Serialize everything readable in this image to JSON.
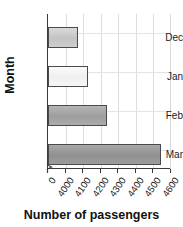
{
  "chart_data": {
    "type": "bar",
    "orientation": "horizontal",
    "title": "",
    "xlabel": "Number of passengers",
    "ylabel": "Month",
    "categories": [
      "Dec",
      "Jan",
      "Feb",
      "Mar"
    ],
    "values": [
      4120,
      4180,
      4285,
      4590
    ],
    "xlim": [
      3950,
      4650
    ],
    "xticks": [
      0,
      4000,
      4100,
      4200,
      4300,
      4400,
      4500,
      4600
    ],
    "xtick_labels": [
      "0",
      "4000",
      "4100",
      "4200",
      "4300",
      "4400",
      "4500",
      "4600"
    ],
    "axis_break": true,
    "grid": true,
    "legend": "none",
    "bar_colors": [
      "#c9c9c9",
      "#f2f2f2",
      "#a6a6a6",
      "#9a9a9a"
    ],
    "bar_edge_color": "#4a4a4a",
    "series": [
      {
        "name": "Number of passengers",
        "values": [
          4120,
          4180,
          4285,
          4590
        ]
      }
    ]
  },
  "axes": {
    "y_title": "Month",
    "x_title": "Number of passengers"
  },
  "ticks": {
    "y": [
      "Dec",
      "Jan",
      "Feb",
      "Mar"
    ],
    "x": [
      "0",
      "4000",
      "4100",
      "4200",
      "4300",
      "4400",
      "4500",
      "4600"
    ]
  },
  "title": {
    "text": ""
  }
}
